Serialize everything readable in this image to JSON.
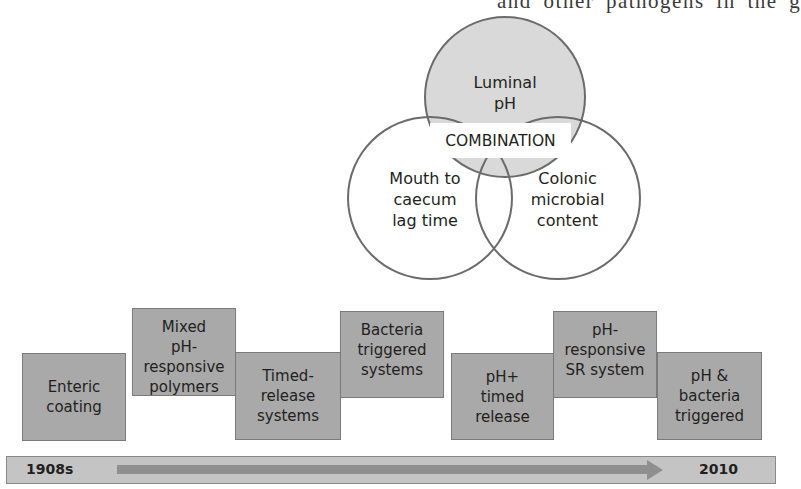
{
  "page": {
    "top_text_fragment": "and other pathogens in the g"
  },
  "venn": {
    "circles": [
      {
        "id": "luminal-ph",
        "label": "Luminal\npH"
      },
      {
        "id": "mouth-to-caecum",
        "label": "Mouth to\ncaecum\nlag time"
      },
      {
        "id": "colonic-microbial",
        "label": "Colonic\nmicrobial\ncontent"
      }
    ],
    "center_label": "COMBINATION"
  },
  "timeline_boxes": [
    {
      "label": "Enteric\ncoating"
    },
    {
      "label": "Mixed\npH-responsive\npolymers"
    },
    {
      "label": "Timed-\nrelease\nsystems"
    },
    {
      "label": "Bacteria\ntriggered\nsystems"
    },
    {
      "label": "pH+\ntimed\nrelease"
    },
    {
      "label": "pH-responsive\nSR system"
    },
    {
      "label": "pH &\nbacteria\ntriggered"
    }
  ],
  "timeline": {
    "start_label": "1908s",
    "end_label": "2010"
  },
  "colors": {
    "circle_fill": "#d9d9d9",
    "circle_stroke": "#6b6b6b",
    "box_fill": "#a9a9a9",
    "timeline_fill": "#c4c4c4",
    "arrow": "#8f8f8f"
  }
}
